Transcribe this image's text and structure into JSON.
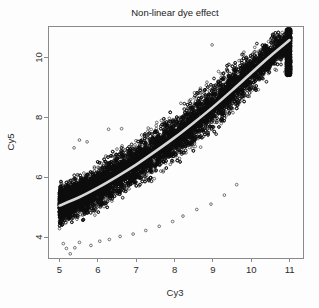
{
  "figure": {
    "width": 319,
    "height": 308,
    "background": "#fdfdfd"
  },
  "chart_data": {
    "type": "scatter",
    "title": "Non-linear dye effect",
    "xlabel": "Cy3",
    "ylabel": "Cy5",
    "xlim": [
      4.7,
      11.35
    ],
    "ylim": [
      3.3,
      11.05
    ],
    "xticks": [
      5,
      6,
      7,
      8,
      9,
      10,
      11
    ],
    "xticklabels": [
      "5",
      "6",
      "7",
      "8",
      "9",
      "10",
      "11"
    ],
    "yticks": [
      4,
      6,
      8,
      10
    ],
    "yticklabels": [
      "4",
      "6",
      "8",
      "10"
    ],
    "grid": false,
    "legend": false,
    "marker": "open-circle",
    "marker_color": "#0d0d0d",
    "point_count_approx": 14000,
    "series": [
      {
        "name": "probes",
        "kind": "cloud",
        "comment": "Main point cloud: center follows the lowess curve, spread grows with intensity.",
        "spine": [
          {
            "x": 5.0,
            "y": 5.05,
            "spread": 0.62
          },
          {
            "x": 5.3,
            "y": 5.22,
            "spread": 0.66
          },
          {
            "x": 5.6,
            "y": 5.4,
            "spread": 0.7
          },
          {
            "x": 5.9,
            "y": 5.6,
            "spread": 0.73
          },
          {
            "x": 6.2,
            "y": 5.82,
            "spread": 0.75
          },
          {
            "x": 6.5,
            "y": 6.05,
            "spread": 0.76
          },
          {
            "x": 6.8,
            "y": 6.28,
            "spread": 0.77
          },
          {
            "x": 7.1,
            "y": 6.52,
            "spread": 0.78
          },
          {
            "x": 7.4,
            "y": 6.78,
            "spread": 0.79
          },
          {
            "x": 7.7,
            "y": 7.04,
            "spread": 0.8
          },
          {
            "x": 8.0,
            "y": 7.32,
            "spread": 0.81
          },
          {
            "x": 8.3,
            "y": 7.62,
            "spread": 0.82
          },
          {
            "x": 8.6,
            "y": 7.93,
            "spread": 0.83
          },
          {
            "x": 8.9,
            "y": 8.25,
            "spread": 0.83
          },
          {
            "x": 9.2,
            "y": 8.58,
            "spread": 0.82
          },
          {
            "x": 9.5,
            "y": 8.93,
            "spread": 0.8
          },
          {
            "x": 9.8,
            "y": 9.28,
            "spread": 0.76
          },
          {
            "x": 10.1,
            "y": 9.62,
            "spread": 0.7
          },
          {
            "x": 10.4,
            "y": 9.95,
            "spread": 0.62
          },
          {
            "x": 10.7,
            "y": 10.26,
            "spread": 0.52
          },
          {
            "x": 11.0,
            "y": 10.55,
            "spread": 0.42
          }
        ]
      },
      {
        "name": "saturation-band",
        "kind": "vertical-pileup",
        "x": 11.0,
        "y_from": 9.4,
        "y_to": 10.95,
        "comment": "Dense clipped column of points at the maximum Cy3 value."
      },
      {
        "name": "low-outliers",
        "kind": "points",
        "points": [
          {
            "x": 5.28,
            "y": 3.44
          },
          {
            "x": 5.18,
            "y": 3.62
          },
          {
            "x": 5.4,
            "y": 3.64
          },
          {
            "x": 5.1,
            "y": 3.78
          },
          {
            "x": 5.52,
            "y": 3.82
          },
          {
            "x": 5.82,
            "y": 3.72
          },
          {
            "x": 6.05,
            "y": 3.86
          },
          {
            "x": 6.3,
            "y": 3.92
          },
          {
            "x": 6.58,
            "y": 4.02
          },
          {
            "x": 6.92,
            "y": 4.1
          },
          {
            "x": 7.25,
            "y": 4.22
          },
          {
            "x": 7.6,
            "y": 4.36
          },
          {
            "x": 7.95,
            "y": 4.52
          },
          {
            "x": 8.22,
            "y": 4.7
          },
          {
            "x": 8.58,
            "y": 4.92
          },
          {
            "x": 8.95,
            "y": 5.1
          },
          {
            "x": 9.3,
            "y": 5.4
          },
          {
            "x": 9.62,
            "y": 5.75
          }
        ]
      },
      {
        "name": "high-outliers",
        "kind": "points",
        "points": [
          {
            "x": 8.98,
            "y": 10.42
          },
          {
            "x": 8.52,
            "y": 8.82
          },
          {
            "x": 8.68,
            "y": 8.8
          },
          {
            "x": 6.28,
            "y": 7.6
          },
          {
            "x": 6.62,
            "y": 7.62
          },
          {
            "x": 5.52,
            "y": 7.24
          },
          {
            "x": 5.72,
            "y": 7.18
          },
          {
            "x": 5.38,
            "y": 6.98
          },
          {
            "x": 10.88,
            "y": 9.52
          },
          {
            "x": 10.62,
            "y": 9.6
          }
        ]
      }
    ],
    "smooth": {
      "name": "lowess",
      "color": "#d8d8d8",
      "width": 2.6,
      "points": [
        {
          "x": 5.0,
          "y": 5.05
        },
        {
          "x": 5.5,
          "y": 5.32
        },
        {
          "x": 6.0,
          "y": 5.65
        },
        {
          "x": 6.5,
          "y": 6.02
        },
        {
          "x": 7.0,
          "y": 6.42
        },
        {
          "x": 7.5,
          "y": 6.86
        },
        {
          "x": 8.0,
          "y": 7.32
        },
        {
          "x": 8.5,
          "y": 7.82
        },
        {
          "x": 9.0,
          "y": 8.34
        },
        {
          "x": 9.5,
          "y": 8.9
        },
        {
          "x": 10.0,
          "y": 9.48
        },
        {
          "x": 10.5,
          "y": 10.05
        },
        {
          "x": 11.0,
          "y": 10.58
        }
      ]
    }
  },
  "geometry": {
    "plot_left": 48,
    "plot_right": 303,
    "plot_top": 26,
    "plot_bottom": 258,
    "title_x": 175,
    "title_y": 16,
    "xlabel_x": 175,
    "xlabel_y": 296,
    "ylabel_x": 14,
    "ylabel_y": 142
  }
}
